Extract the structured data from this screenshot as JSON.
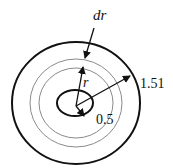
{
  "diagram": {
    "labels": {
      "dr": "dr",
      "r": "r",
      "outer_radius": "1.51",
      "inner_radius": "0.5"
    },
    "colors": {
      "stroke": "#111111",
      "ring": "#8a8a8a",
      "background": "#ffffff"
    },
    "shapes": {
      "outer_circle": "outer boundary radius 1.51",
      "inner_circle": "inner boundary radius 0.5",
      "ring_elements": "thin annular element of width dr at radius r"
    }
  }
}
